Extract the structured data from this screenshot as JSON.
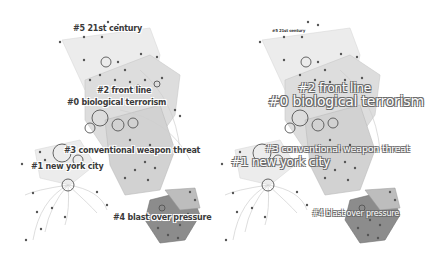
{
  "figure": {
    "type": "cluster co-citation network (two views)",
    "colors": {
      "background": "#ffffff",
      "hull_light": "#e4e4e4",
      "hull_mid": "#c8c8c8",
      "hull_dark": "#8c8c8c",
      "node": "#555555",
      "label": "#3a3a3a"
    }
  },
  "left_panel": {
    "clusters": [
      {
        "id": "#5",
        "label": "#5 21st century"
      },
      {
        "id": "#2",
        "label": "#2 front line"
      },
      {
        "id": "#0",
        "label": "#0 biological terrorism"
      },
      {
        "id": "#3",
        "label": "#3 conventional weapon threat"
      },
      {
        "id": "#1",
        "label": "#1 new york city"
      },
      {
        "id": "#4",
        "label": "#4 blast over pressure"
      }
    ]
  },
  "right_panel": {
    "clusters": [
      {
        "id": "#5",
        "label": "#5 21st century"
      },
      {
        "id": "#2",
        "label": "#2 front line"
      },
      {
        "id": "#0",
        "label": "#0 biological terrorism"
      },
      {
        "id": "#3",
        "label": "#3 conventional weapon threat"
      },
      {
        "id": "#1",
        "label": "#1 new york city"
      },
      {
        "id": "#4",
        "label": "#4 blast over pressure"
      }
    ]
  }
}
